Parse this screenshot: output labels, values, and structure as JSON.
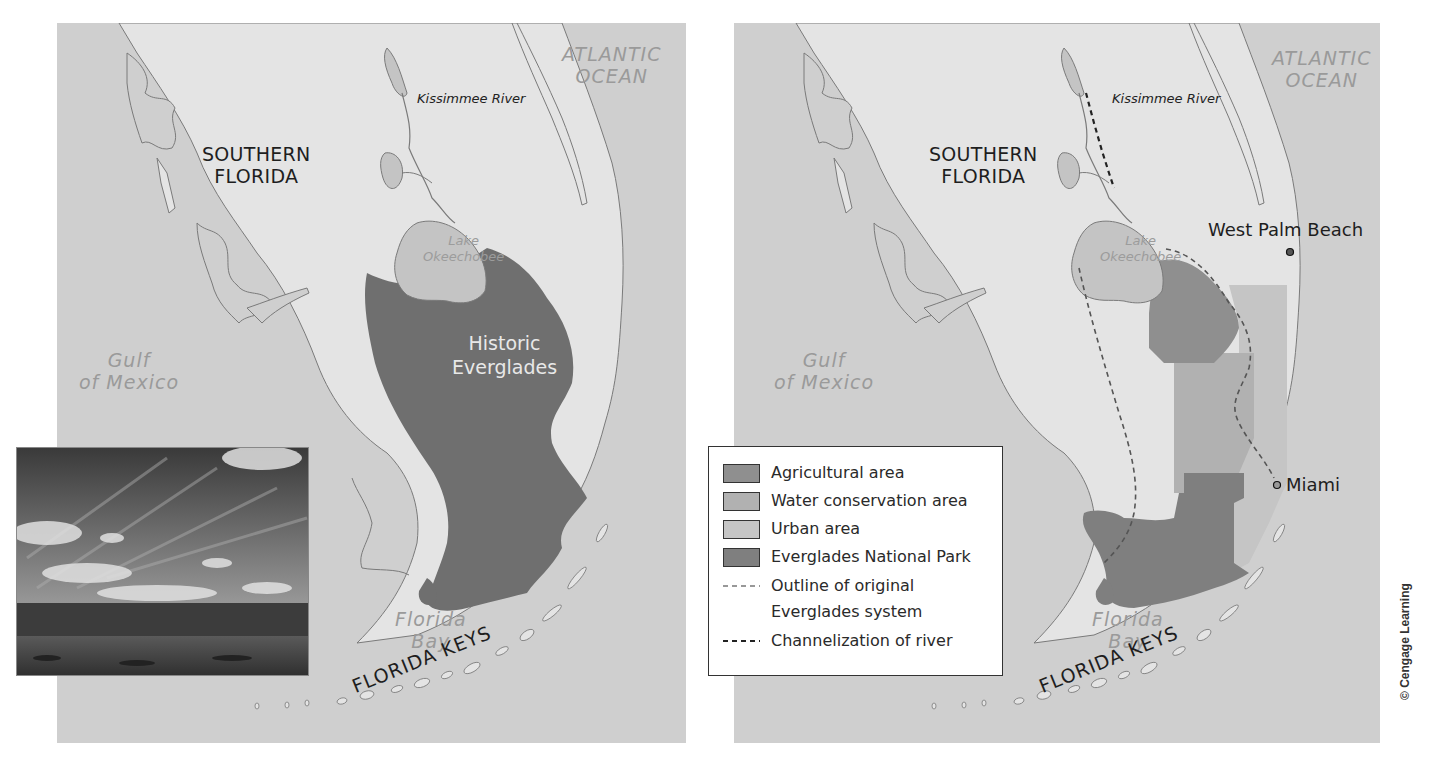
{
  "colors": {
    "ocean": "#cfcfcf",
    "land": "#e4e4e4",
    "lake": "#c4c4c4",
    "coast_line": "#7a7a7a",
    "historic_everglades": "#6f6f6f",
    "agricultural": "#8f8f8f",
    "water_conservation": "#b1b1b1",
    "urban": "#c5c5c5",
    "national_park": "#7f7f7f",
    "dashed_outline": "#555555",
    "dashed_channel": "#222222"
  },
  "left_map": {
    "region_label_line1": "SOUTHERN",
    "region_label_line2": "FLORIDA",
    "ocean_east_line1": "ATLANTIC",
    "ocean_east_line2": "OCEAN",
    "river_label": "Kissimmee River",
    "lake_label_line1": "Lake",
    "lake_label_line2": "Okeechobee",
    "historic_label_line1": "Historic",
    "historic_label_line2": "Everglades",
    "gulf_label_line1": "Gulf",
    "gulf_label_line2": "of Mexico",
    "bay_label_line1": "Florida",
    "bay_label_line2": "Bay",
    "keys_label": "FLORIDA KEYS"
  },
  "right_map": {
    "region_label_line1": "SOUTHERN",
    "region_label_line2": "FLORIDA",
    "ocean_east_line1": "ATLANTIC",
    "ocean_east_line2": "OCEAN",
    "river_label": "Kissimmee River",
    "lake_label_line1": "Lake",
    "lake_label_line2": "Okeechobee",
    "gulf_label_line1": "Gulf",
    "gulf_label_line2": "of Mexico",
    "bay_label_line1": "Florida",
    "bay_label_line2": "Bay",
    "keys_label": "FLORIDA KEYS",
    "cities": [
      {
        "name": "West Palm Beach"
      },
      {
        "name": "Miami"
      }
    ]
  },
  "legend": {
    "items": [
      {
        "label": "Agricultural area",
        "type": "swatch"
      },
      {
        "label": "Water conservation area",
        "type": "swatch"
      },
      {
        "label": "Urban area",
        "type": "swatch"
      },
      {
        "label": "Everglades National Park",
        "type": "swatch"
      },
      {
        "label_line1": "Outline of original",
        "label_line2": "Everglades system",
        "type": "dashed-thin"
      },
      {
        "label": "Channelization of river",
        "type": "dashed-bold"
      }
    ]
  },
  "photo": {
    "subject": "Everglades wetland landscape with sawgrass, water, and cloudy sky"
  },
  "credit": "© Cengage Learning"
}
